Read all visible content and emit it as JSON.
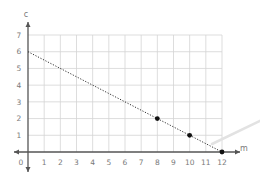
{
  "chart_data": {
    "type": "line",
    "title": "",
    "xlabel": "m",
    "ylabel": "c",
    "xlim": [
      0,
      12
    ],
    "ylim": [
      0,
      7
    ],
    "grid": true,
    "x_ticks": [
      "1",
      "2",
      "3",
      "4",
      "5",
      "6",
      "7",
      "8",
      "9",
      "10",
      "11",
      "12"
    ],
    "y_ticks": [
      "1",
      "2",
      "3",
      "4",
      "5",
      "6",
      "7"
    ],
    "origin_label": "0",
    "series": [
      {
        "name": "line",
        "style": "dotted",
        "x": [
          0,
          12
        ],
        "y": [
          6,
          0
        ]
      }
    ],
    "points": [
      {
        "x": 8,
        "y": 2
      },
      {
        "x": 10,
        "y": 1
      },
      {
        "x": 12,
        "y": 0
      }
    ]
  }
}
